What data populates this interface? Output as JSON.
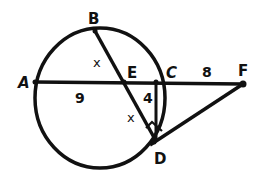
{
  "diagram": {
    "type": "circle-geometry",
    "stroke_color": "#111111",
    "background": "#ffffff",
    "circle": {
      "cx": 100,
      "cy": 98,
      "rx": 65,
      "ry": 70
    },
    "points": {
      "A": {
        "label": "A",
        "x": 35,
        "y": 82
      },
      "B": {
        "label": "B",
        "x": 95,
        "y": 31
      },
      "C": {
        "label": "C",
        "x": 156,
        "y": 82
      },
      "D": {
        "label": "D",
        "x": 156,
        "y": 141
      },
      "E": {
        "label": "E",
        "x": 124,
        "y": 82
      },
      "F": {
        "label": "F",
        "x": 243,
        "y": 84
      }
    },
    "segments": [
      {
        "from": "A",
        "to": "F",
        "name": "secant-AF"
      },
      {
        "from": "B",
        "to": "D",
        "name": "chord-BD"
      },
      {
        "from": "C",
        "to": "D",
        "name": "chord-CD"
      },
      {
        "from": "D",
        "to": "F",
        "name": "tangent-DF"
      }
    ],
    "measures": {
      "AE": "9",
      "EC": "4",
      "CF": "8",
      "BE": "x",
      "ED": "x"
    },
    "right_angle_marker_at": "D"
  }
}
